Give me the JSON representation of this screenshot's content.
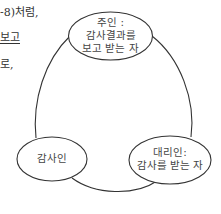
{
  "side_text": {
    "line1": "-8)처럼,",
    "line2": "보고",
    "line3": "로,"
  },
  "diagram": {
    "nodes": [
      {
        "id": "principal",
        "lines": [
          "주인 :",
          "감사결과를",
          "보고 받는 자"
        ]
      },
      {
        "id": "auditor",
        "lines": [
          "감사인"
        ]
      },
      {
        "id": "agent",
        "lines": [
          "대리인:",
          "감사를 받는 자"
        ]
      }
    ],
    "line_color": "#333333"
  }
}
